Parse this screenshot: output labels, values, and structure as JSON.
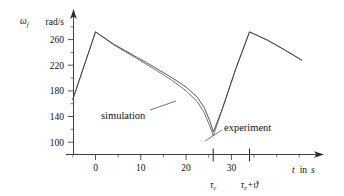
{
  "chart_data": {
    "type": "line",
    "title": "",
    "ylabel": "ω_f",
    "yunit": "rad/s",
    "xlabel": "t  in  s",
    "xlim": [
      -7,
      47
    ],
    "ylim": [
      88,
      286
    ],
    "yticks": [
      100,
      140,
      180,
      220,
      260
    ],
    "ytick_labels": [
      "100",
      "140",
      "180",
      "220",
      "260"
    ],
    "xticks": [
      0,
      10,
      20,
      30
    ],
    "xtick_labels": [
      "0",
      "10",
      "20",
      "30"
    ],
    "grid": false,
    "legend": "inline-annotations",
    "markers": [
      {
        "name": "tau_c",
        "x": 26,
        "label": "τ",
        "sub": "c"
      },
      {
        "name": "tau_c_plus_theta",
        "x": 34,
        "label": "τ",
        "sub": "c",
        "suffix": "+ϑ"
      }
    ],
    "annotations": [
      {
        "name": "simulation",
        "text": "simulation",
        "x": 8.5,
        "y": 152
      },
      {
        "name": "experiment",
        "text": "experiment",
        "x": 31.5,
        "y": 133
      }
    ],
    "series": [
      {
        "name": "simulation",
        "color": "#5a5a5a",
        "x": [
          -5.0,
          0.0,
          4.0,
          9.0,
          13.0,
          17.0,
          20.0,
          22.5,
          24.0,
          25.3,
          26.0,
          28.0,
          31.0,
          34.0,
          38.0,
          42.0,
          45.5
        ],
        "y": [
          167,
          272,
          252,
          231,
          214,
          196,
          180,
          163,
          146,
          124,
          110,
          152,
          215,
          272,
          259,
          243,
          228
        ]
      },
      {
        "name": "experiment",
        "color": "#3a3a3a",
        "x": [
          -5.0,
          0.0,
          4.0,
          9.0,
          13.0,
          17.0,
          20.0,
          22.5,
          24.0,
          25.3,
          26.0,
          28.0,
          31.0,
          34.0,
          38.0,
          42.0,
          45.5
        ],
        "y": [
          167,
          272,
          253,
          233,
          217,
          200,
          186,
          170,
          154,
          132,
          116,
          152,
          215,
          272,
          259,
          243,
          228
        ]
      }
    ]
  },
  "axis": {
    "y_unit_label": "rad/s",
    "y_symbol": "ω",
    "y_symbol_sub": "f",
    "x_label_t": "t",
    "x_label_in": "in",
    "x_label_s": "s"
  }
}
